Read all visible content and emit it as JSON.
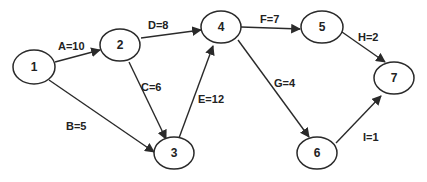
{
  "diagram": {
    "type": "activity-network",
    "nodes": [
      {
        "id": "1",
        "label": "1"
      },
      {
        "id": "2",
        "label": "2"
      },
      {
        "id": "3",
        "label": "3"
      },
      {
        "id": "4",
        "label": "4"
      },
      {
        "id": "5",
        "label": "5"
      },
      {
        "id": "6",
        "label": "6"
      },
      {
        "id": "7",
        "label": "7"
      }
    ],
    "edges": [
      {
        "from": "1",
        "to": "2",
        "label": "A=10"
      },
      {
        "from": "1",
        "to": "3",
        "label": "B=5"
      },
      {
        "from": "2",
        "to": "3",
        "label": "C=6"
      },
      {
        "from": "2",
        "to": "4",
        "label": "D=8"
      },
      {
        "from": "3",
        "to": "4",
        "label": "E=12"
      },
      {
        "from": "4",
        "to": "5",
        "label": "F=7"
      },
      {
        "from": "4",
        "to": "6",
        "label": "G=4"
      },
      {
        "from": "5",
        "to": "7",
        "label": "H=2"
      },
      {
        "from": "6",
        "to": "7",
        "label": "I=1"
      }
    ]
  }
}
